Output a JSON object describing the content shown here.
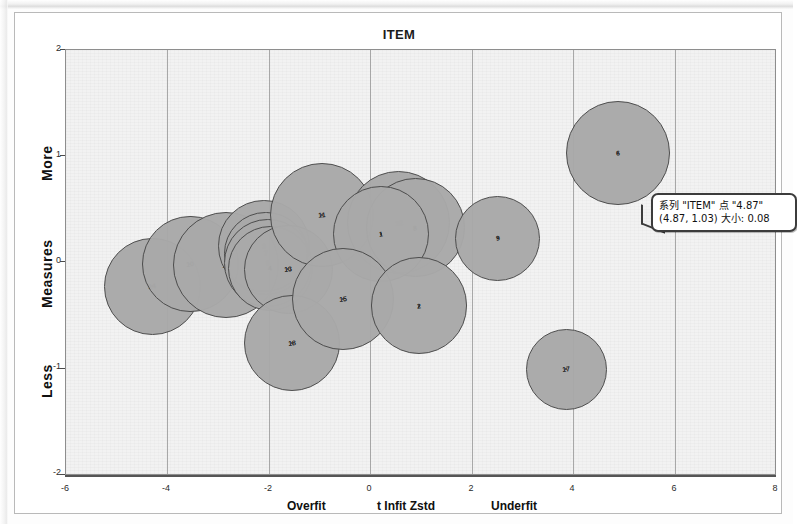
{
  "chart_data": {
    "type": "scatter",
    "title": "ITEM",
    "xlabel": "t Infit Zstd",
    "ylabel": "Measures",
    "xlim": [
      -6,
      8
    ],
    "ylim": [
      -2,
      2
    ],
    "xticks": [
      "-6",
      "-4",
      "-2",
      "0",
      "2",
      "4",
      "6",
      "8"
    ],
    "yticks": [
      "2",
      "1",
      "0",
      "-1",
      "-2"
    ],
    "grid": "vertical",
    "legend": "none",
    "x_axis_left_caption": "Overfit",
    "x_axis_center_caption": "t Infit Zstd",
    "x_axis_right_caption": "Underfit",
    "y_axis_top_caption": "More",
    "y_axis_center_caption": "Measures",
    "y_axis_bottom_caption": "Less",
    "bubble_color": "#a9a9a9",
    "bubble_border_color": "#4a4a4a",
    "plot_background": "#f2f2f2",
    "points": [
      {
        "label": "14",
        "x": -4.3,
        "y": -0.22,
        "size": 0.93
      },
      {
        "label": "10",
        "x": -3.55,
        "y": -0.01,
        "size": 0.93
      },
      {
        "label": "16",
        "x": -2.85,
        "y": -0.02,
        "size": 1.02
      },
      {
        "label": "3",
        "x": -2.1,
        "y": 0.16,
        "size": 0.88
      },
      {
        "label": "7",
        "x": -2.06,
        "y": 0.09,
        "size": 0.8
      },
      {
        "label": "5",
        "x": -2.02,
        "y": 0.0,
        "size": 0.84
      },
      {
        "label": "4",
        "x": -1.98,
        "y": -0.05,
        "size": 0.82
      },
      {
        "label": "13",
        "x": -1.62,
        "y": -0.06,
        "size": 0.86
      },
      {
        "label": "11",
        "x": -0.95,
        "y": 0.45,
        "size": 1.0
      },
      {
        "label": "12",
        "x": 0.55,
        "y": 0.38,
        "size": 0.99
      },
      {
        "label": "8",
        "x": 0.88,
        "y": 0.33,
        "size": 0.95
      },
      {
        "label": "1",
        "x": 0.2,
        "y": 0.27,
        "size": 0.92
      },
      {
        "label": "18",
        "x": -1.55,
        "y": -0.75,
        "size": 0.93
      },
      {
        "label": "15",
        "x": -0.55,
        "y": -0.34,
        "size": 0.98
      },
      {
        "label": "2",
        "x": 0.95,
        "y": -0.4,
        "size": 0.93
      },
      {
        "label": "9",
        "x": 2.5,
        "y": 0.23,
        "size": 0.82
      },
      {
        "label": "6",
        "x": 4.87,
        "y": 1.03,
        "size": 0.08
      },
      {
        "label": "17",
        "x": 3.85,
        "y": -1.0,
        "size": 0.78
      }
    ]
  },
  "tooltip": {
    "line1": "系列 \"ITEM\" 点 \"4.87\"",
    "line2": "(4.87, 1.03) 大小: 0.08",
    "series_name": "ITEM",
    "point_name": "4.87",
    "x": "4.87",
    "y": "1.03",
    "size": "0.08"
  }
}
